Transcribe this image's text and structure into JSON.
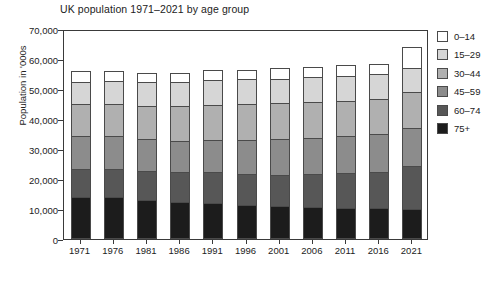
{
  "chart_data": {
    "type": "bar",
    "subtype": "stacked-vertical",
    "title": "UK population 1971–2021 by age group",
    "xlabel": "",
    "ylabel": "Population in '000s",
    "ylim": [
      0,
      70000
    ],
    "ytick_labels": [
      "70,000",
      "60,000",
      "50,000",
      "40,000",
      "30,000",
      "20,000",
      "10,000",
      "0"
    ],
    "ytick_values": [
      70000,
      60000,
      50000,
      40000,
      30000,
      20000,
      10000,
      0
    ],
    "grid": false,
    "legend_position": "right",
    "categories": [
      "1971",
      "1976",
      "1981",
      "1986",
      "1991",
      "1996",
      "2001",
      "2006",
      "2011",
      "2016",
      "2021"
    ],
    "stack_order_bottom_to_top": [
      "75+",
      "60–74",
      "45–59",
      "30–44",
      "15–29",
      "0–14"
    ],
    "series": [
      {
        "name": "75+",
        "color": "#1c1c1c",
        "values": [
          14000,
          14000,
          13000,
          12500,
          12000,
          11500,
          11000,
          10800,
          10500,
          10300,
          10000
        ]
      },
      {
        "name": "60–74",
        "color": "#575757",
        "values": [
          9500,
          9500,
          9800,
          10000,
          10200,
          10300,
          10500,
          11000,
          11500,
          12200,
          14500
        ]
      },
      {
        "name": "45–59",
        "color": "#8c8c8c",
        "values": [
          11000,
          10800,
          10500,
          10300,
          10800,
          11200,
          11800,
          12000,
          12200,
          12500,
          12500
        ]
      },
      {
        "name": "30–44",
        "color": "#b0b0b0",
        "values": [
          10500,
          10800,
          11200,
          11500,
          11800,
          12000,
          12200,
          12000,
          11800,
          11700,
          12000
        ]
      },
      {
        "name": "15–29",
        "color": "#d6d6d6",
        "values": [
          7500,
          7700,
          8000,
          8200,
          8300,
          8200,
          8000,
          8200,
          8500,
          8300,
          8000
        ]
      },
      {
        "name": "0–14",
        "color": "#ffffff",
        "values": [
          3500,
          3200,
          3000,
          3000,
          3400,
          3300,
          3500,
          3500,
          3500,
          3500,
          7000
        ]
      }
    ],
    "totals": [
      56000,
      56000,
      55500,
      55500,
      56500,
      56500,
      57000,
      57500,
      58000,
      58500,
      64000
    ]
  },
  "legend": {
    "items": [
      {
        "label": "0–14",
        "color": "#ffffff"
      },
      {
        "label": "15–29",
        "color": "#d6d6d6"
      },
      {
        "label": "30–44",
        "color": "#b0b0b0"
      },
      {
        "label": "45–59",
        "color": "#8c8c8c"
      },
      {
        "label": "60–74",
        "color": "#575757"
      },
      {
        "label": "75+",
        "color": "#1c1c1c"
      }
    ]
  }
}
